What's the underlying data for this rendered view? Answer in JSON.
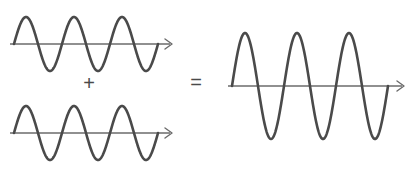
{
  "figure": {
    "stroke_color": "#4a4a4a",
    "axis_color": "#6b6b6b",
    "background_color": "#ffffff",
    "wave_stroke_width": 2.6,
    "axis_stroke_width": 1.4,
    "operators": {
      "plus": {
        "label": "+",
        "x": 89,
        "y": 85,
        "font_size": 20
      },
      "equals": {
        "label": "=",
        "x": 196,
        "y": 84,
        "font_size": 20
      }
    },
    "waves": [
      {
        "name": "input-wave-top",
        "amplitude": 27,
        "cycles": 3,
        "phase_deg": 0,
        "axis_y": 44,
        "x_start": 14,
        "x_end": 158,
        "arrow_tip_x": 172,
        "arrow_size": 7
      },
      {
        "name": "input-wave-bottom",
        "amplitude": 27,
        "cycles": 3,
        "phase_deg": 0,
        "axis_y": 133,
        "x_start": 14,
        "x_end": 158,
        "arrow_tip_x": 172,
        "arrow_size": 7
      },
      {
        "name": "resultant-wave",
        "amplitude": 53,
        "cycles": 3,
        "phase_deg": 0,
        "axis_y": 86,
        "x_start": 232,
        "x_end": 388,
        "arrow_tip_x": 404,
        "arrow_size": 7
      }
    ]
  },
  "chart_data": {
    "type": "line",
    "xlabel": "",
    "ylabel": "",
    "grid": false,
    "legend": "none",
    "panels": [
      {
        "name": "input-wave-top",
        "expression": "y = A sin(2πx/T)",
        "amplitude": 1,
        "cycles": 3,
        "phase_deg": 0,
        "ylim": [
          -1,
          1
        ],
        "xlim": [
          0,
          3
        ]
      },
      {
        "name": "input-wave-bottom",
        "expression": "y = A sin(2πx/T)",
        "amplitude": 1,
        "cycles": 3,
        "phase_deg": 0,
        "ylim": [
          -1,
          1
        ],
        "xlim": [
          0,
          3
        ]
      },
      {
        "name": "resultant-wave",
        "expression": "y = 2A sin(2πx/T)",
        "amplitude": 2,
        "cycles": 3,
        "phase_deg": 0,
        "ylim": [
          -2,
          2
        ],
        "xlim": [
          0,
          3
        ]
      }
    ],
    "annotations": [
      "+",
      "="
    ]
  }
}
